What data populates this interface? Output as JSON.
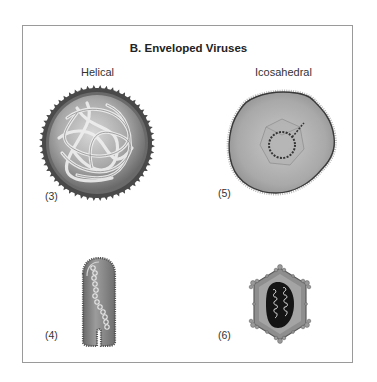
{
  "figure": {
    "title": "B. Enveloped Viruses",
    "columns": [
      {
        "label": "Helical"
      },
      {
        "label": "Icosahedral"
      }
    ],
    "panels": [
      {
        "number": "(3)",
        "type": "helical",
        "shape": "spherical spiked envelope with coiled nucleocapsid"
      },
      {
        "number": "(4)",
        "type": "helical",
        "shape": "bullet/rod-shaped envelope with helical nucleocapsid"
      },
      {
        "number": "(5)",
        "type": "icosahedral",
        "shape": "irregular envelope with icosahedral capsid"
      },
      {
        "number": "(6)",
        "type": "icosahedral",
        "shape": "hexagonal capsid with spiked vertices"
      }
    ],
    "colors": {
      "border": "#9a9a9a",
      "envelope_dark": "#5a5a5a",
      "envelope_mid": "#9a9a9a",
      "envelope_light": "#d6d6d6",
      "core_dark": "#1a1a1a"
    }
  }
}
